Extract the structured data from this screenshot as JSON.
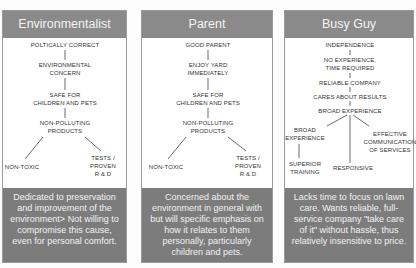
{
  "panels": [
    {
      "title": "Environmentalist",
      "nodes": {
        "n1": "POLTICALLY CORRECT",
        "n2a": "ENVIRONMENTAL",
        "n2b": "CONCERN",
        "n3a": "SAFE FOR",
        "n3b": "CHILDREN AND PETS",
        "n4a": "NON-POLLUTING",
        "n4b": "PRODUCTS",
        "n5": "NON-TOXIC",
        "n6a": "TESTS /",
        "n6b": "PROVEN",
        "n6c": "R & D"
      },
      "description": "Dedicated to preservation and improvement of the environment> Not willing to compromise this cause, even for personal comfort."
    },
    {
      "title": "Parent",
      "nodes": {
        "n1": "GOOD PARENT",
        "n2a": "ENJOY YARD",
        "n2b": "IMMEDIATELY",
        "n3a": "SAFE FOR",
        "n3b": "CHILDREN AND PETS",
        "n4a": "NON-POLLUTING",
        "n4b": "PRODUCTS",
        "n5": "NON-TOXIC",
        "n6a": "TESTS /",
        "n6b": "PROVEN",
        "n6c": "R & D"
      },
      "description": "Concerned about the environment in general with but will specific emphasis on how it relates to them personally, particularly children and pets."
    },
    {
      "title": "Busy Guy",
      "nodes": {
        "n1": "INDEPENDENCE",
        "n2a": "NO EXPERIENCE,",
        "n2b": "TIME REQUIRED",
        "n3": "RELIABLE COMPANY",
        "n4": "CARES ABOUT RESULTS",
        "n5": "BROAD EXPERIENCE",
        "n6a": "BROAD",
        "n6b": "EXPERIENCE",
        "n7a": "EFFECTIVE",
        "n7b": "COMMUNICATION",
        "n7c": "OF SERVICES",
        "n8a": "SUPERIOR",
        "n8b": "TRAINING",
        "n9": "RESPONSIVE"
      },
      "description": "Lacks time to focus on lawn care. Wants reliable, full-service company \"take care of it\" without hassle, thus relatively insensitive to price."
    }
  ],
  "colors": {
    "header_bg": "#8a8a8a",
    "footer_bg": "#7c7c7c",
    "panel_border": "#9a9a9a"
  }
}
